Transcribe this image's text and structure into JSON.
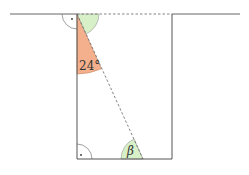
{
  "diagram": {
    "labels": {
      "angle_given": "24°",
      "angle_unknown": "β",
      "right_angle_mark": "·"
    },
    "colors": {
      "line": "#555555",
      "orange_sector": "#f4b08c",
      "green_sector": "#d8f0c8",
      "arc_stroke": "#777777",
      "background": "#ffffff"
    }
  }
}
